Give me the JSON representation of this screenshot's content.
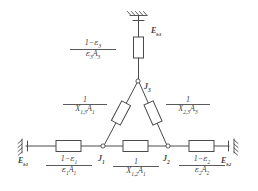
{
  "figure": {
    "type": "radiation-network-circuit",
    "line_color": "#4a4a4a",
    "background_color": "#ffffff"
  },
  "nodes": [
    {
      "id": "J1",
      "base": "J",
      "sub": "1",
      "x": 103,
      "y": 146
    },
    {
      "id": "J2",
      "base": "J",
      "sub": "2",
      "x": 168,
      "y": 146
    },
    {
      "id": "J3",
      "base": "J",
      "sub": "3",
      "x": 137,
      "y": 82
    }
  ],
  "terminals": [
    {
      "id": "Eb1",
      "base": "E",
      "sub": "b1",
      "position": "bottom-left",
      "x": 24,
      "y": 160
    },
    {
      "id": "Eb2",
      "base": "E",
      "sub": "b2",
      "position": "bottom-right",
      "x": 222,
      "y": 160
    },
    {
      "id": "Eb3",
      "base": "E",
      "sub": "b3",
      "position": "top",
      "x": 160,
      "y": 33
    }
  ],
  "resistors": [
    {
      "id": "surface-1",
      "kind": "surface-resistance",
      "orientation": "horizontal",
      "between": [
        "Eb1",
        "J1"
      ],
      "label": {
        "numerator": "1−ε1",
        "denominator": "ε1A1",
        "num_parts": [
          "1",
          "−",
          "ε",
          "1"
        ],
        "den_parts": [
          "ε",
          "1",
          "A",
          "1"
        ]
      }
    },
    {
      "id": "surface-2",
      "kind": "surface-resistance",
      "orientation": "horizontal",
      "between": [
        "J2",
        "Eb2"
      ],
      "label": {
        "numerator": "1−ε2",
        "denominator": "ε2A2",
        "num_parts": [
          "1",
          "−",
          "ε",
          "2"
        ],
        "den_parts": [
          "ε",
          "2",
          "A",
          "2"
        ]
      }
    },
    {
      "id": "surface-3",
      "kind": "surface-resistance",
      "orientation": "vertical",
      "between": [
        "Eb3",
        "J3"
      ],
      "label": {
        "numerator": "1−ε3",
        "denominator": "ε3A3",
        "num_parts": [
          "1",
          "−",
          "ε",
          "3"
        ],
        "den_parts": [
          "ε",
          "3",
          "A",
          "3"
        ]
      }
    },
    {
      "id": "space-12",
      "kind": "space-resistance",
      "orientation": "horizontal",
      "between": [
        "J1",
        "J2"
      ],
      "label": {
        "numerator": "1",
        "denominator": "X1,2A1",
        "den_parts": [
          "X",
          "1,2",
          "A",
          "1"
        ]
      }
    },
    {
      "id": "space-13",
      "kind": "space-resistance",
      "orientation": "diagonal-left",
      "between": [
        "J1",
        "J3"
      ],
      "label": {
        "numerator": "1",
        "denominator": "X1,3A1",
        "den_parts": [
          "X",
          "1,3",
          "A",
          "1"
        ]
      }
    },
    {
      "id": "space-23",
      "kind": "space-resistance",
      "orientation": "diagonal-right",
      "between": [
        "J2",
        "J3"
      ],
      "label": {
        "numerator": "1",
        "denominator": "X2,3A3",
        "den_parts": [
          "X",
          "2,3",
          "A",
          "3"
        ]
      }
    }
  ],
  "labels": {
    "J1": "J",
    "J1_sub": "1",
    "J2": "J",
    "J2_sub": "2",
    "J3": "J",
    "J3_sub": "3",
    "Eb_left": "E",
    "Eb_left_sub": "b1",
    "Eb_right": "E",
    "Eb_right_sub": "b2",
    "Eb_top": "E",
    "Eb_top_sub": "b3",
    "one": "1",
    "minus": "−",
    "eps": "ε",
    "A": "A",
    "X": "X",
    "sub1": "1",
    "sub2": "2",
    "sub3": "3",
    "sub12": "1,2",
    "sub13": "1,3",
    "sub23": "2,3"
  }
}
